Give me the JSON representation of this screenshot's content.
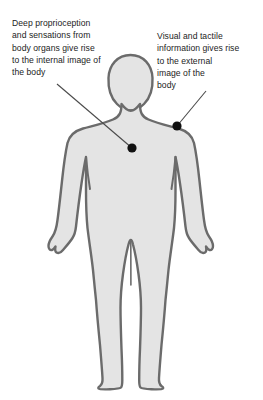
{
  "figure": {
    "background_color": "#ffffff",
    "body_fill_color": "#e4e4e4",
    "body_outline_color": "#6b6b6b",
    "marker_color": "#111111",
    "leader_line_color": "#4a4a4a",
    "text_color": "#1c1c1c"
  },
  "annotations": {
    "internal": {
      "label": "internal-image-annotation",
      "text": "Deep proprioception\nand sensations from\nbody organs give rise\nto the internal image of\nthe body",
      "lines": [
        "Deep proprioception",
        "and sensations from",
        "body organs give rise",
        "to the internal image of",
        "the body"
      ],
      "marker_point": {
        "x": 132,
        "y": 148
      },
      "leader_start": {
        "x": 57,
        "y": 84
      }
    },
    "external": {
      "label": "external-image-annotation",
      "text": "Visual and tactile\ninformation gives rise\nto the external\nimage of the\nbody",
      "lines": [
        "Visual and tactile",
        "information gives rise",
        "to the external",
        "image of the",
        "body"
      ],
      "marker_point": {
        "x": 177,
        "y": 126
      },
      "leader_start": {
        "x": 206,
        "y": 91
      }
    }
  },
  "body_parts": [
    "head",
    "neck",
    "shoulders",
    "torso",
    "left-arm",
    "right-arm",
    "left-hand",
    "right-hand",
    "left-leg",
    "right-leg",
    "left-foot",
    "right-foot"
  ]
}
